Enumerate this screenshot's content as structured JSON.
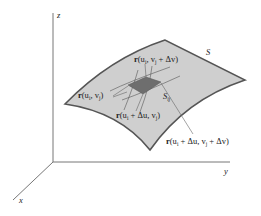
{
  "figure": {
    "axes": {
      "z_label": "z",
      "y_label": "y",
      "x_label": "x"
    },
    "surface": {
      "name": "S",
      "fill": "#cfcfcf",
      "edge": "#555555"
    },
    "patch": {
      "name": "S",
      "subscript": "ij",
      "fill": "#6e6e6e"
    },
    "labels": {
      "corner_top": {
        "r": "r",
        "args": "(u",
        "i": "i",
        "mid": ", v",
        "j": "j",
        "tail": " + Δv)"
      },
      "corner_left": {
        "r": "r",
        "args": "(u",
        "i": "i",
        "mid": ", v",
        "j": "j",
        "tail": ")"
      },
      "corner_bottom": {
        "r": "r",
        "args": "(u",
        "i": "i",
        "mid": " + Δu, v",
        "j": "j",
        "tail": ")"
      },
      "corner_right": {
        "r": "r",
        "args": "(u",
        "i": "i",
        "mid": " + Δu, v",
        "j": "j",
        "tail": " + Δv)"
      }
    }
  }
}
